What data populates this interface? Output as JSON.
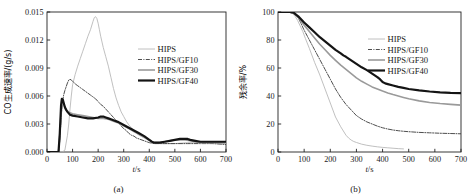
{
  "figure": {
    "panels": [
      {
        "caption": "(a)",
        "xlabel_italic": "t",
        "xlabel_rest": "/s",
        "ylabel": "CO生成速率/(g/s)"
      },
      {
        "caption": "(b)",
        "xlabel_italic": "t",
        "xlabel_rest": "/s",
        "ylabel": "残余率/%"
      }
    ]
  },
  "colors": {
    "hips": "#b9b9b9",
    "gf10": "#3a3a3a",
    "gf30": "#9a9a9a",
    "gf40": "#141414",
    "axis": "#222222"
  },
  "chart_data": [
    {
      "type": "line",
      "title": "",
      "panel": "(a)",
      "xlabel": "t/s",
      "ylabel": "CO生成速率/(g/s)",
      "xlim": [
        0,
        700
      ],
      "ylim": [
        0,
        0.015
      ],
      "xticks": [
        0,
        100,
        200,
        300,
        400,
        500,
        600,
        700
      ],
      "yticks": [
        0.0,
        0.003,
        0.006,
        0.009,
        0.012,
        0.015
      ],
      "ytick_labels": [
        "0.000",
        "0.003",
        "0.006",
        "0.009",
        "0.012",
        "0.015"
      ],
      "xtick_labels": [
        "0",
        "100",
        "200",
        "300",
        "400",
        "500",
        "600",
        "700"
      ],
      "grid": false,
      "legend_position": "upper-right",
      "series": [
        {
          "name": "HIPS",
          "style": "solid-thin-light",
          "x": [
            0,
            60,
            70,
            80,
            85,
            90,
            95,
            100,
            110,
            120,
            130,
            140,
            150,
            160,
            170,
            180,
            185,
            190,
            195,
            200,
            205,
            210,
            220,
            230,
            240,
            250,
            260,
            270,
            280,
            290,
            300,
            310,
            320,
            330,
            340,
            350,
            360,
            380,
            400,
            420,
            450,
            500,
            550,
            600,
            650,
            700
          ],
          "y": [
            0.0,
            0.0,
            0.0002,
            0.0018,
            0.003,
            0.0046,
            0.006,
            0.0072,
            0.0083,
            0.0092,
            0.01,
            0.0108,
            0.0116,
            0.0124,
            0.0131,
            0.014,
            0.0144,
            0.0145,
            0.0143,
            0.0138,
            0.0131,
            0.0124,
            0.0112,
            0.0102,
            0.0092,
            0.008,
            0.0068,
            0.0058,
            0.005,
            0.0043,
            0.0038,
            0.0033,
            0.0029,
            0.0026,
            0.0023,
            0.002,
            0.0018,
            0.0015,
            0.0012,
            0.001,
            0.0009,
            0.0009,
            0.001,
            0.001,
            0.0009,
            0.0009
          ]
        },
        {
          "name": "HIPS/GF10",
          "style": "dash-dot-dark",
          "x": [
            0,
            45,
            50,
            55,
            60,
            65,
            70,
            75,
            80,
            85,
            90,
            95,
            100,
            110,
            120,
            130,
            140,
            150,
            160,
            170,
            180,
            190,
            200,
            210,
            220,
            230,
            240,
            250,
            260,
            270,
            280,
            290,
            300,
            310,
            320,
            330,
            340,
            350,
            360,
            380,
            400,
            420,
            440,
            460,
            480,
            500,
            550,
            600,
            650,
            700
          ],
          "y": [
            0.0,
            0.0,
            0.0012,
            0.0035,
            0.0052,
            0.0061,
            0.0066,
            0.007,
            0.0074,
            0.0077,
            0.0078,
            0.0077,
            0.0076,
            0.0073,
            0.0071,
            0.0069,
            0.0067,
            0.0065,
            0.0063,
            0.0061,
            0.0059,
            0.0057,
            0.0054,
            0.0051,
            0.0049,
            0.0046,
            0.0043,
            0.004,
            0.0037,
            0.0034,
            0.0031,
            0.0028,
            0.0025,
            0.0023,
            0.002,
            0.0018,
            0.0017,
            0.0015,
            0.0014,
            0.0012,
            0.001,
            0.0009,
            0.0009,
            0.0009,
            0.0009,
            0.0009,
            0.0009,
            0.0009,
            0.0009,
            0.0008
          ]
        },
        {
          "name": "HIPS/GF30",
          "style": "solid-mid-gray",
          "x": [
            0,
            45,
            50,
            55,
            60,
            65,
            70,
            80,
            90,
            100,
            120,
            140,
            160,
            180,
            200,
            220,
            240,
            260,
            280,
            300,
            320,
            340,
            360,
            380,
            400,
            410,
            420,
            440,
            460,
            480,
            500,
            520,
            540,
            560,
            580,
            600,
            620,
            640,
            660,
            680,
            700
          ],
          "y": [
            0.0,
            0.0,
            0.0018,
            0.0042,
            0.0054,
            0.0052,
            0.0048,
            0.0044,
            0.0042,
            0.0041,
            0.004,
            0.0039,
            0.0038,
            0.0037,
            0.0036,
            0.0036,
            0.0035,
            0.0033,
            0.0031,
            0.0028,
            0.0025,
            0.0022,
            0.0019,
            0.0016,
            0.0013,
            0.0011,
            0.001,
            0.001,
            0.0011,
            0.0012,
            0.0013,
            0.0013,
            0.0013,
            0.0012,
            0.0011,
            0.001,
            0.001,
            0.001,
            0.001,
            0.001,
            0.001
          ]
        },
        {
          "name": "HIPS/GF40",
          "style": "solid-thick-black",
          "x": [
            0,
            45,
            50,
            55,
            58,
            62,
            66,
            70,
            75,
            80,
            90,
            100,
            120,
            140,
            160,
            180,
            200,
            210,
            220,
            230,
            240,
            250,
            260,
            280,
            300,
            320,
            340,
            360,
            380,
            400,
            410,
            420,
            430,
            440,
            460,
            480,
            500,
            520,
            540,
            550,
            560,
            580,
            600,
            620,
            640,
            660,
            680,
            700
          ],
          "y": [
            0.0,
            0.0,
            0.002,
            0.005,
            0.0057,
            0.0056,
            0.0052,
            0.0048,
            0.0045,
            0.0043,
            0.004,
            0.0039,
            0.0038,
            0.0037,
            0.0036,
            0.0036,
            0.0037,
            0.0038,
            0.0038,
            0.0037,
            0.0036,
            0.0035,
            0.0034,
            0.0032,
            0.0029,
            0.0026,
            0.0023,
            0.002,
            0.0017,
            0.0013,
            0.0011,
            0.001,
            0.001,
            0.001,
            0.0011,
            0.0012,
            0.0013,
            0.0014,
            0.0014,
            0.0014,
            0.0013,
            0.0012,
            0.0011,
            0.0011,
            0.0011,
            0.0011,
            0.0011,
            0.0011
          ]
        }
      ],
      "legend": [
        "HIPS",
        "HIPS/GF10",
        "HIPS/GF30",
        "HIPS/GF40"
      ]
    },
    {
      "type": "line",
      "title": "",
      "panel": "(b)",
      "xlabel": "t/s",
      "ylabel": "残余率/%",
      "xlim": [
        0,
        700
      ],
      "ylim": [
        0,
        100
      ],
      "xticks": [
        0,
        100,
        200,
        300,
        400,
        500,
        600,
        700
      ],
      "yticks": [
        0,
        20,
        40,
        60,
        80,
        100
      ],
      "ytick_labels": [
        "0",
        "20",
        "40",
        "60",
        "80",
        "100"
      ],
      "xtick_labels": [
        "0",
        "100",
        "200",
        "300",
        "400",
        "500",
        "600",
        "700"
      ],
      "grid": false,
      "legend_position": "upper-right",
      "series": [
        {
          "name": "HIPS",
          "style": "solid-thin-light",
          "x": [
            0,
            40,
            55,
            65,
            75,
            85,
            95,
            105,
            120,
            140,
            160,
            180,
            200,
            220,
            240,
            250,
            260,
            270,
            280,
            290,
            300,
            320,
            340,
            360,
            380,
            400,
            420,
            440,
            460,
            480
          ],
          "y": [
            100,
            100,
            99,
            97,
            94,
            90,
            86,
            81,
            74,
            64,
            55,
            45,
            35,
            25,
            18,
            15,
            12,
            10,
            8.5,
            7.5,
            6.8,
            5.6,
            4.8,
            4.2,
            3.7,
            3.3,
            3.0,
            2.7,
            2.4,
            2.2
          ]
        },
        {
          "name": "HIPS/GF10",
          "style": "dash-dot-dark",
          "x": [
            0,
            45,
            60,
            70,
            80,
            90,
            100,
            120,
            140,
            160,
            180,
            200,
            220,
            240,
            260,
            280,
            300,
            320,
            340,
            360,
            380,
            400,
            420,
            440,
            460,
            480,
            500,
            540,
            580,
            620,
            660,
            700
          ],
          "y": [
            100,
            100,
            99,
            97.5,
            95,
            91,
            87,
            80,
            73,
            66,
            59,
            52,
            45,
            39,
            34,
            30,
            26,
            23.5,
            21.5,
            20,
            18.5,
            17.3,
            16.4,
            15.7,
            15.2,
            14.8,
            14.5,
            14.0,
            13.7,
            13.4,
            13.2,
            13.0
          ]
        },
        {
          "name": "HIPS/GF30",
          "style": "solid-mid-gray",
          "x": [
            0,
            45,
            60,
            70,
            80,
            90,
            100,
            120,
            140,
            160,
            180,
            200,
            220,
            240,
            260,
            280,
            300,
            320,
            340,
            360,
            380,
            400,
            420,
            440,
            460,
            480,
            500,
            540,
            580,
            620,
            660,
            700
          ],
          "y": [
            100,
            100,
            99,
            97.5,
            95.5,
            93,
            90.5,
            86,
            81.5,
            77,
            73,
            69,
            65.5,
            62,
            59,
            56,
            53,
            50.5,
            48.5,
            46.5,
            45,
            43.5,
            42.2,
            41,
            40,
            39,
            38,
            36.5,
            35.4,
            34.6,
            34.0,
            33.5
          ]
        },
        {
          "name": "HIPS/GF40",
          "style": "solid-thick-black",
          "x": [
            0,
            45,
            60,
            70,
            80,
            90,
            100,
            120,
            140,
            160,
            180,
            200,
            220,
            240,
            250,
            260,
            280,
            300,
            320,
            340,
            360,
            380,
            390,
            400,
            410,
            420,
            440,
            460,
            480,
            500,
            540,
            580,
            620,
            660,
            700
          ],
          "y": [
            100,
            100,
            99.5,
            98,
            96.5,
            94.5,
            92.5,
            89,
            85.5,
            82,
            79,
            76,
            73,
            70.5,
            69,
            68,
            65.5,
            63,
            60.5,
            58.5,
            56,
            53.5,
            52,
            50,
            49,
            48.5,
            47.5,
            46.5,
            45.8,
            45,
            44,
            43.2,
            42.6,
            42.2,
            42.0
          ]
        }
      ],
      "legend": [
        "HIPS",
        "HIPS/GF10",
        "HIPS/GF30",
        "HIPS/GF40"
      ]
    }
  ]
}
